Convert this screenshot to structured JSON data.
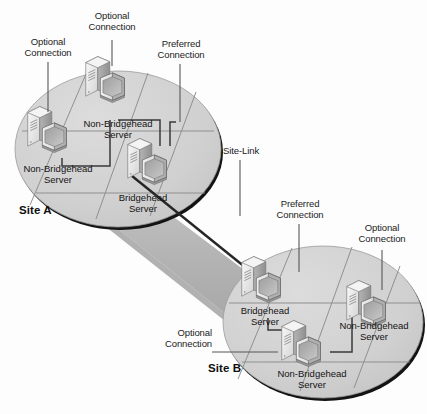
{
  "diagram": {
    "background": "#fdfdfd",
    "ellipse_fill": "#d2d2d2",
    "ellipse_edge": "#111111",
    "band_fill": "#b9b9b9",
    "link_line": "#2b2b2b"
  },
  "sites": [
    {
      "id": "site-a",
      "name": "Site A"
    },
    {
      "id": "site-b",
      "name": "Site B"
    }
  ],
  "servers": [
    {
      "id": "a-nbh-left",
      "site": "Site A",
      "role": "Non-Bridgehead",
      "label": "Non-Bridgehead\nServer"
    },
    {
      "id": "a-nbh-top",
      "site": "Site A",
      "role": "Non-Bridgehead",
      "label": "Non-Bridgehead\nServer"
    },
    {
      "id": "a-bh",
      "site": "Site A",
      "role": "Bridgehead",
      "label": "Bridgehead\nServer"
    },
    {
      "id": "b-bh",
      "site": "Site B",
      "role": "Bridgehead",
      "label": "Bridgehead\nServer"
    },
    {
      "id": "b-nbh-right",
      "site": "Site B",
      "role": "Non-Bridgehead",
      "label": "Non-Bridgehead\nServer"
    },
    {
      "id": "b-nbh-bot",
      "site": "Site B",
      "role": "Non-Bridgehead",
      "label": "Non-Bridgehead\nServer"
    }
  ],
  "callouts": [
    {
      "id": "callout-optional-a-left",
      "text": "Optional\nConnection",
      "type": "Optional"
    },
    {
      "id": "callout-optional-a-top",
      "text": "Optional\nConnection",
      "type": "Optional"
    },
    {
      "id": "callout-preferred-a",
      "text": "Preferred\nConnection",
      "type": "Preferred"
    },
    {
      "id": "callout-site-link",
      "text": "Site-Link",
      "type": "Site-Link"
    },
    {
      "id": "callout-preferred-b",
      "text": "Preferred\nConnection",
      "type": "Preferred"
    },
    {
      "id": "callout-optional-b-right",
      "text": "Optional\nConnection",
      "type": "Optional"
    },
    {
      "id": "callout-optional-b-left",
      "text": "Optional\nConnection",
      "type": "Optional"
    }
  ]
}
